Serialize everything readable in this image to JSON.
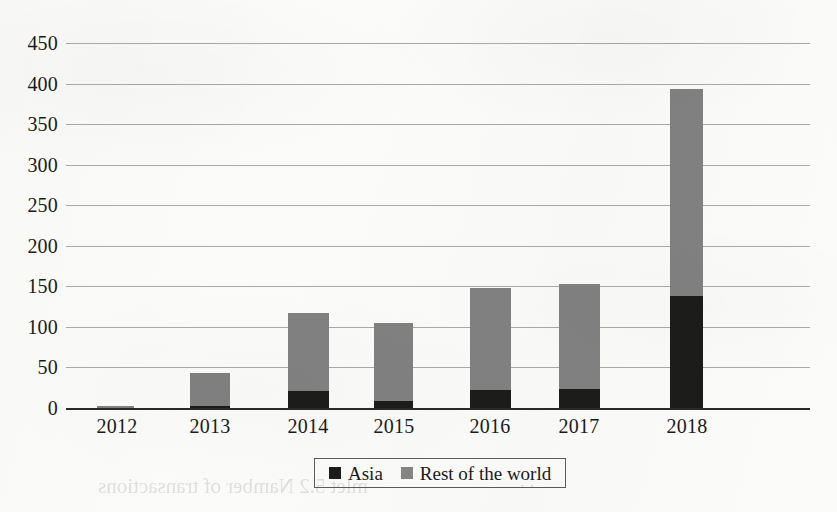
{
  "chart_data": {
    "type": "bar",
    "subtype": "stacked-vertical",
    "title": "",
    "xlabel": "",
    "ylabel": "",
    "categories": [
      "2012",
      "2013",
      "2014",
      "2015",
      "2016",
      "2017",
      "2018"
    ],
    "series": [
      {
        "name": "Asia",
        "color": "#1c1c1a",
        "values": [
          0,
          2,
          21,
          9,
          22,
          23,
          138
        ]
      },
      {
        "name": "Rest of the world",
        "color": "#818181",
        "values": [
          3,
          41,
          96,
          96,
          126,
          130,
          255
        ]
      }
    ],
    "totals": [
      3,
      43,
      117,
      105,
      148,
      153,
      393
    ],
    "ylim": [
      0,
      450
    ],
    "yticks": [
      0,
      50,
      100,
      150,
      200,
      250,
      300,
      350,
      400,
      450
    ],
    "ytick_labels": [
      "0",
      "50",
      "100",
      "150",
      "200",
      "250",
      "300",
      "350",
      "400",
      "450"
    ],
    "grid": true,
    "grid_axis": "y",
    "legend": {
      "position": "bottom-center",
      "bordered": true,
      "entries": [
        {
          "label": "Asia",
          "color": "#1c1c1a"
        },
        {
          "label": "Rest of the world",
          "color": "#858585"
        }
      ]
    }
  },
  "bar_layout": [
    {
      "category": "2012",
      "left": 31,
      "width": 37,
      "label_center": 51
    },
    {
      "category": "2013",
      "left": 124,
      "width": 40,
      "label_center": 144
    },
    {
      "category": "2014",
      "left": 222,
      "width": 41,
      "label_center": 242
    },
    {
      "category": "2015",
      "left": 308,
      "width": 39,
      "label_center": 328
    },
    {
      "category": "2016",
      "left": 404,
      "width": 41,
      "label_center": 424
    },
    {
      "category": "2017",
      "left": 493,
      "width": 41,
      "label_center": 513
    },
    {
      "category": "2018",
      "left": 604,
      "width": 33,
      "label_center": 621
    }
  ],
  "ghost_text": {
    "bottom": "mlet 5.2 Namber of transactions",
    "mid": ". ."
  }
}
